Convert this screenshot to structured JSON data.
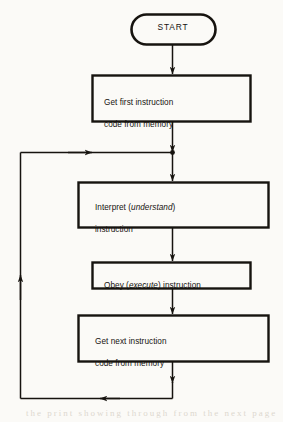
{
  "diagram": {
    "type": "flowchart",
    "background_color": "#fbfaf7",
    "stroke_color": "#16130f",
    "nodes": [
      {
        "id": "start",
        "shape": "terminator",
        "label": "START"
      },
      {
        "id": "get-first-instruction",
        "shape": "process",
        "line1": "Get first instruction",
        "line2": "code from memory"
      },
      {
        "id": "interpret-instruction",
        "shape": "process",
        "line1_pre": "Interpret (",
        "line1_em": "understand",
        "line1_post": ")",
        "line2": "instruction"
      },
      {
        "id": "obey-instruction",
        "shape": "process",
        "line1_pre": "Obey (",
        "line1_em": "execute",
        "line1_post": ") instruction"
      },
      {
        "id": "get-next-instruction",
        "shape": "process",
        "line1": "Get next instruction",
        "line2": "code from memory"
      }
    ],
    "edges": [
      {
        "id": "start-to-get-first",
        "from": "start",
        "to": "get-first-instruction",
        "direction": "down"
      },
      {
        "id": "get-first-to-junction",
        "from": "get-first-instruction",
        "to": "loop-junction",
        "direction": "down"
      },
      {
        "id": "junction-to-interpret",
        "from": "loop-junction",
        "to": "interpret-instruction",
        "direction": "down"
      },
      {
        "id": "interpret-to-obey",
        "from": "interpret-instruction",
        "to": "obey-instruction",
        "direction": "down"
      },
      {
        "id": "obey-to-get-next",
        "from": "obey-instruction",
        "to": "get-next-instruction",
        "direction": "down"
      },
      {
        "id": "get-next-to-loop-bottom",
        "from": "get-next-instruction",
        "to": "loop-bottom",
        "direction": "down"
      },
      {
        "id": "loop-bottom-left",
        "from": "loop-bottom",
        "to": "loop-left",
        "direction": "left"
      },
      {
        "id": "loop-left-up",
        "from": "loop-left",
        "to": "loop-top",
        "direction": "up"
      },
      {
        "id": "loop-top-right",
        "from": "loop-top",
        "to": "loop-junction",
        "direction": "right"
      }
    ],
    "junction_marker": "filled-dot"
  },
  "page_artifacts": {
    "bleed_text": "the print showing through from the next page"
  }
}
